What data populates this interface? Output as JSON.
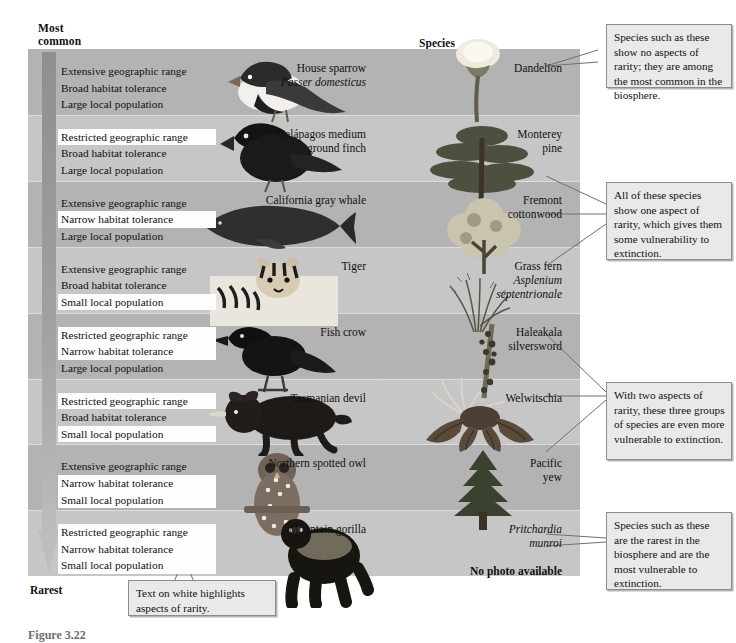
{
  "figure": {
    "axis_top_label": "Most\ncommon",
    "axis_top_line1": "Most",
    "axis_top_line2": "common",
    "axis_bottom_label": "Rarest",
    "column_header": "Species",
    "caption": "Figure 3.22"
  },
  "attribute_options": {
    "range_extensive": "Extensive geographic range",
    "range_restricted": "Restricted geographic range",
    "habitat_broad": "Broad habitat tolerance",
    "habitat_narrow": "Narrow habitat tolerance",
    "population_large": "Large local population",
    "population_small": "Small local population"
  },
  "rows": [
    {
      "index": 1,
      "band": "dark",
      "attributes": [
        {
          "text": "Extensive geographic range",
          "highlighted": false
        },
        {
          "text": "Broad habitat tolerance",
          "highlighted": false
        },
        {
          "text": "Large local population",
          "highlighted": false
        }
      ],
      "animal": {
        "name": "House sparrow",
        "scientific": "Passer domesticus"
      },
      "plant": {
        "name": "Dandelion",
        "scientific": ""
      },
      "rarity_aspects": 0
    },
    {
      "index": 2,
      "band": "light",
      "attributes": [
        {
          "text": "Restricted geographic range",
          "highlighted": true
        },
        {
          "text": "Broad habitat tolerance",
          "highlighted": false
        },
        {
          "text": "Large local population",
          "highlighted": false
        }
      ],
      "animal": {
        "name": "Galápagos medium\nground finch",
        "line1": "Galápagos medium",
        "line2": "ground finch"
      },
      "plant": {
        "name": "Monterey\npine",
        "line1": "Monterey",
        "line2": "pine"
      },
      "rarity_aspects": 1
    },
    {
      "index": 3,
      "band": "dark",
      "attributes": [
        {
          "text": "Extensive geographic range",
          "highlighted": false
        },
        {
          "text": "Narrow habitat tolerance",
          "highlighted": true
        },
        {
          "text": "Large local population",
          "highlighted": false
        }
      ],
      "animal": {
        "name": "California gray whale"
      },
      "plant": {
        "line1": "Fremont",
        "line2": "cottonwood"
      },
      "rarity_aspects": 1
    },
    {
      "index": 4,
      "band": "light",
      "attributes": [
        {
          "text": "Extensive geographic range",
          "highlighted": false
        },
        {
          "text": "Broad habitat tolerance",
          "highlighted": false
        },
        {
          "text": "Small local population",
          "highlighted": true
        }
      ],
      "animal": {
        "name": "Tiger"
      },
      "plant": {
        "line1": "Grass fern",
        "scientific_line1": "Asplenium",
        "scientific_line2": "septentrionale"
      },
      "rarity_aspects": 1
    },
    {
      "index": 5,
      "band": "dark",
      "attributes": [
        {
          "text": "Restricted geographic range",
          "highlighted": true
        },
        {
          "text": "Narrow habitat tolerance",
          "highlighted": true
        },
        {
          "text": "Large local population",
          "highlighted": false
        }
      ],
      "animal": {
        "name": "Fish crow"
      },
      "plant": {
        "line1": "Haleakala",
        "line2": "silversword"
      },
      "rarity_aspects": 2
    },
    {
      "index": 6,
      "band": "light",
      "attributes": [
        {
          "text": "Restricted geographic range",
          "highlighted": true
        },
        {
          "text": "Broad habitat tolerance",
          "highlighted": false
        },
        {
          "text": "Small local population",
          "highlighted": true
        }
      ],
      "animal": {
        "name": "Tasmanian devil"
      },
      "plant": {
        "line1": "Welwitschia"
      },
      "rarity_aspects": 2
    },
    {
      "index": 7,
      "band": "dark",
      "attributes": [
        {
          "text": "Extensive geographic range",
          "highlighted": false
        },
        {
          "text": "Narrow habitat tolerance",
          "highlighted": true
        },
        {
          "text": "Small local population",
          "highlighted": true
        }
      ],
      "animal": {
        "name": "Northern spotted owl"
      },
      "plant": {
        "line1": "Pacific",
        "line2": "yew"
      },
      "rarity_aspects": 2
    },
    {
      "index": 8,
      "band": "light",
      "attributes": [
        {
          "text": "Restricted geographic range",
          "highlighted": true
        },
        {
          "text": "Narrow habitat tolerance",
          "highlighted": true
        },
        {
          "text": "Small local population",
          "highlighted": true
        }
      ],
      "animal": {
        "name": "Mountain gorilla"
      },
      "plant": {
        "scientific_line1": "Pritchardia",
        "scientific_line2": "munroi",
        "note": "No photo available"
      },
      "rarity_aspects": 3
    }
  ],
  "callouts": [
    {
      "id": "callout-common",
      "text": "Species such as these show no aspects of rarity; they are among the most common in the biosphere."
    },
    {
      "id": "callout-one-aspect",
      "text": "All of these species show one aspect of rarity, which gives them some vulnerability to extinction."
    },
    {
      "id": "callout-two-aspects",
      "text": "With two aspects of rarity, these three groups of species are even more vulnerable to extinction."
    },
    {
      "id": "callout-rarest",
      "text": "Species such as these are the rarest in the biosphere and are the most vulnerable to extinction."
    },
    {
      "id": "callout-legend",
      "text": "Text on white highlights aspects of rarity."
    }
  ],
  "colors": {
    "panel_dark_band": "#b3b3b3",
    "panel_light_band": "#c6c6c6",
    "highlight": "#fdfdfd",
    "callout_fill": "#e9e9e9",
    "callout_border": "#8d8d8d",
    "arrow_gray": "#9a9a9a"
  }
}
